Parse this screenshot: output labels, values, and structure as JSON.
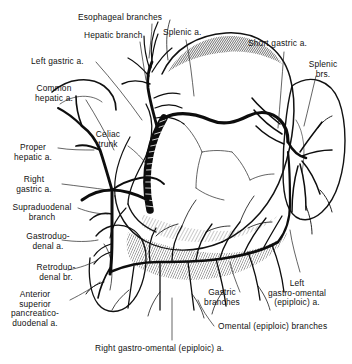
{
  "figure": {
    "style": "engraving",
    "background_color": "#ffffff",
    "ink_color": "#111111",
    "width": 352,
    "height": 364
  },
  "labels": [
    {
      "id": "esophageal-branches",
      "text": "Esophageal branches",
      "x": 78,
      "y": 13,
      "align": "left"
    },
    {
      "id": "hepatic-branch",
      "text": "Hepatic branch",
      "x": 84,
      "y": 31,
      "align": "left"
    },
    {
      "id": "left-gastric-a",
      "text": "Left gastric a.",
      "x": 31,
      "y": 57,
      "align": "left"
    },
    {
      "id": "common-hepatic-a",
      "text": "Common\nhepatic a.",
      "x": 54,
      "y": 84,
      "align": "center"
    },
    {
      "id": "proper-hepatic-a",
      "text": "Proper\nhepatic a.",
      "x": 24,
      "y": 143,
      "align": "center"
    },
    {
      "id": "right-gastric-a",
      "text": "Right\ngastric a.",
      "x": 26,
      "y": 175,
      "align": "center"
    },
    {
      "id": "supraduodenal-branch",
      "text": "Supraduodenal\nbranch",
      "x": 4,
      "y": 203,
      "align": "left"
    },
    {
      "id": "gastroduodenal-a",
      "text": "Gastroduo-\ndenal a.",
      "x": 18,
      "y": 232,
      "align": "center"
    },
    {
      "id": "retroduodenal-br",
      "text": "Retroduo-\ndenal br.",
      "x": 28,
      "y": 263,
      "align": "center"
    },
    {
      "id": "anterior-superior-pancreaticoduodenal-a",
      "text": "Anterior\nsuperior\npancreatico-\nduodenal a.",
      "x": 30,
      "y": 290,
      "align": "center"
    },
    {
      "id": "celiac-trunk",
      "text": "Celiac\ntrunk",
      "x": 108,
      "y": 130,
      "align": "center"
    },
    {
      "id": "splenic-a",
      "text": "Splenic a.",
      "x": 163,
      "y": 28,
      "align": "left"
    },
    {
      "id": "short-gastric-a",
      "text": "Short gastric a.",
      "x": 248,
      "y": 39,
      "align": "left"
    },
    {
      "id": "splenic-brs",
      "text": "Splenic\nbrs.",
      "x": 315,
      "y": 60,
      "align": "center"
    },
    {
      "id": "left-gastro-omental-epiploic-a",
      "text": "Left\ngastro-omental\n(epiploic) a.",
      "x": 297,
      "y": 279,
      "align": "center"
    },
    {
      "id": "gastric-branches",
      "text": "Gastric\nbranches",
      "x": 222,
      "y": 288,
      "align": "center"
    },
    {
      "id": "omental-epiploic-branches",
      "text": "Omental (epiploic) branches",
      "x": 218,
      "y": 322,
      "align": "left"
    },
    {
      "id": "right-gastro-omental-epiploic-a",
      "text": "Right gastro-omental (epiploic) a.",
      "x": 95,
      "y": 344,
      "align": "left"
    }
  ],
  "structures": [
    {
      "id": "stomach",
      "name": "Stomach body and fundus"
    },
    {
      "id": "spleen",
      "name": "Spleen"
    },
    {
      "id": "duodenum",
      "name": "Duodenum"
    },
    {
      "id": "pancreas",
      "name": "Pancreas"
    },
    {
      "id": "esophagus",
      "name": "Esophagus"
    }
  ]
}
